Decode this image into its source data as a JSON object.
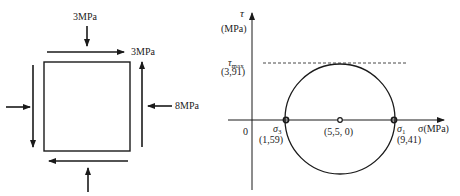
{
  "stress_element": {
    "top_normal_label": "3MPa",
    "shear_label": "3MPa",
    "right_normal_label": "8MPa"
  },
  "mohr_circle": {
    "tau_axis_symbol": "τ",
    "tau_axis_unit": "(MPa)",
    "sigma_axis_label": "σ(MPa)",
    "origin_label": "0",
    "tau_max_symbol": "τ",
    "tau_max_sub": "max",
    "tau_max_value": "(3,91)",
    "sigma3_symbol": "σ",
    "sigma3_sub": "3",
    "sigma3_value": "(1,59)",
    "center_value": "(5,5, 0)",
    "sigma1_symbol": "σ",
    "sigma1_sub": "1",
    "sigma1_value": "(9,41)"
  },
  "colors": {
    "stroke": "#1a1a1a"
  }
}
